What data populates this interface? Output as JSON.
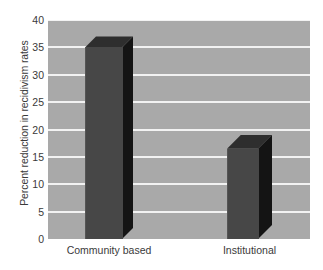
{
  "chart_data": {
    "type": "bar",
    "title": "",
    "xlabel": "",
    "ylabel": "Percent reduction in recidivism rates",
    "categories": [
      "Community based",
      "Institutional"
    ],
    "values": [
      35,
      16.5
    ],
    "ylim": [
      0,
      40
    ],
    "yticks": [
      0,
      5,
      10,
      15,
      20,
      25,
      30,
      35,
      40
    ],
    "ytick_labels": [
      "0",
      "5",
      "10",
      "15",
      "20",
      "25",
      "30",
      "35",
      "40"
    ],
    "grid": true,
    "legend": "none",
    "style": {
      "plot_background": "#a9a9a9",
      "gridline_color": "#f2f2f2",
      "bar_front_color": "#474747",
      "bar_side_color": "#141414",
      "bar_top_color": "#2e2e2e",
      "figure_background": "#ffffff",
      "text_color": "#3a3a3a"
    }
  }
}
